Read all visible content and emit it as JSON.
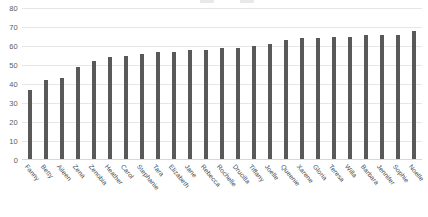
{
  "chart_data": {
    "type": "bar",
    "title": "",
    "subtitle": "",
    "xlabel": "",
    "ylabel": "",
    "ylim": [
      0,
      80
    ],
    "yticks": [
      0,
      10,
      20,
      30,
      40,
      50,
      60,
      70,
      80
    ],
    "grid": true,
    "legend_position": "top",
    "bar_color": "#595959",
    "gridline_color": "#e6e6e6",
    "categories": [
      "Fanny",
      "Betty",
      "Aileen",
      "Zena",
      "Zenobia",
      "Heather",
      "Carol",
      "Stephanie",
      "Tara",
      "Elizabeth",
      "Jane",
      "Rebecca",
      "Rochelle",
      "Drucilla",
      "Tiffany",
      "Joelle",
      "Queenie",
      "Xarene",
      "Gloria",
      "Teresa",
      "Willa",
      "Barbara",
      "Jennifer",
      "Sophie",
      "Noelle"
    ],
    "values": [
      37,
      42,
      43,
      49,
      52,
      54,
      55,
      56,
      57,
      57,
      58,
      58,
      59,
      59,
      60,
      61,
      63,
      64,
      64,
      65,
      65,
      66,
      66,
      66,
      68
    ]
  },
  "legend": {
    "items": [
      "",
      ""
    ]
  }
}
